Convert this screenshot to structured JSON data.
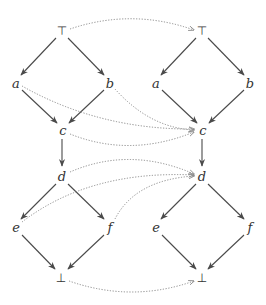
{
  "diagram": {
    "type": "hasse-diagram-mapping",
    "colors": {
      "edge": "#4a4a4a",
      "mapping": "#8a8a8a",
      "label": "#333333",
      "background": "#ffffff"
    },
    "left_lattice": {
      "nodes": [
        {
          "id": "top",
          "label": "⊤",
          "x": 62,
          "y": 31
        },
        {
          "id": "a",
          "label": "a",
          "x": 16,
          "y": 83
        },
        {
          "id": "b",
          "label": "b",
          "x": 110,
          "y": 83
        },
        {
          "id": "c",
          "label": "c",
          "x": 63,
          "y": 130
        },
        {
          "id": "d",
          "label": "d",
          "x": 62,
          "y": 176
        },
        {
          "id": "e",
          "label": "e",
          "x": 16,
          "y": 227
        },
        {
          "id": "f",
          "label": "f",
          "x": 110,
          "y": 227
        },
        {
          "id": "bot",
          "label": "⊥",
          "x": 61,
          "y": 278
        }
      ],
      "edges": [
        [
          "top",
          "a"
        ],
        [
          "top",
          "b"
        ],
        [
          "a",
          "c"
        ],
        [
          "b",
          "c"
        ],
        [
          "c",
          "d"
        ],
        [
          "d",
          "e"
        ],
        [
          "d",
          "f"
        ],
        [
          "e",
          "bot"
        ],
        [
          "f",
          "bot"
        ]
      ]
    },
    "right_lattice": {
      "nodes": [
        {
          "id": "top",
          "label": "⊤",
          "x": 202,
          "y": 31
        },
        {
          "id": "a",
          "label": "a",
          "x": 156,
          "y": 83
        },
        {
          "id": "b",
          "label": "b",
          "x": 250,
          "y": 83
        },
        {
          "id": "c",
          "label": "c",
          "x": 203,
          "y": 130
        },
        {
          "id": "d",
          "label": "d",
          "x": 202,
          "y": 176
        },
        {
          "id": "e",
          "label": "e",
          "x": 156,
          "y": 227
        },
        {
          "id": "f",
          "label": "f",
          "x": 250,
          "y": 227
        },
        {
          "id": "bot",
          "label": "⊥",
          "x": 202,
          "y": 278
        }
      ],
      "edges": [
        [
          "top",
          "a"
        ],
        [
          "top",
          "b"
        ],
        [
          "a",
          "c"
        ],
        [
          "b",
          "c"
        ],
        [
          "c",
          "d"
        ],
        [
          "d",
          "e"
        ],
        [
          "d",
          "f"
        ],
        [
          "e",
          "bot"
        ],
        [
          "f",
          "bot"
        ]
      ]
    },
    "mappings": [
      {
        "from": "top",
        "to": "top"
      },
      {
        "from": "a",
        "to": "c"
      },
      {
        "from": "b",
        "to": "c"
      },
      {
        "from": "c",
        "to": "c"
      },
      {
        "from": "d",
        "to": "d"
      },
      {
        "from": "e",
        "to": "d"
      },
      {
        "from": "f",
        "to": "d"
      },
      {
        "from": "bot",
        "to": "bot"
      }
    ]
  }
}
